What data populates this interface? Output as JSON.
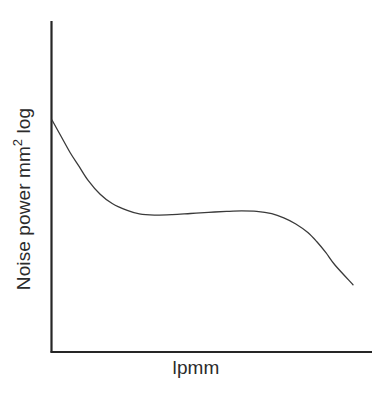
{
  "figure": {
    "background_color": "#ffffff",
    "line_color": "#3a3a3a",
    "axis_color": "#262626"
  },
  "axes": {
    "y_axis_label_prefix": "Noise power mm",
    "y_axis_label_superscript": "2",
    "y_axis_label_suffix": " log",
    "y_axis_label_full": "Noise power mm2 log",
    "x_axis_label": "lpmm"
  },
  "chart_data": {
    "type": "line",
    "title": "",
    "xlabel": "lpmm",
    "ylabel": "Noise power mm2 log",
    "xlim": [
      0,
      100
    ],
    "ylim": [
      0,
      100
    ],
    "grid": false,
    "legend": null,
    "axis_ticks": {
      "x": [],
      "y": []
    },
    "series": [
      {
        "name": "Noise power spectrum",
        "color": "#3a3a3a",
        "line_width": 1.3,
        "x": [
          0,
          3,
          6,
          9,
          12,
          16,
          20,
          25,
          29,
          34,
          40,
          46,
          52,
          58,
          63,
          68,
          73,
          77,
          81,
          85,
          88,
          91,
          94,
          100
        ],
        "y": [
          100,
          93,
          86,
          80,
          74,
          68,
          64,
          61,
          59.5,
          59,
          59.2,
          59.7,
          60.2,
          60.6,
          60.8,
          60.6,
          59.6,
          57.8,
          55.2,
          51.5,
          47.5,
          42.8,
          37.5,
          29
        ],
        "description": "Starts high at left axis, falls steeply, flattens into a broad near-level plateau with a very slight rise, then rolls off steeply toward the right."
      }
    ]
  }
}
